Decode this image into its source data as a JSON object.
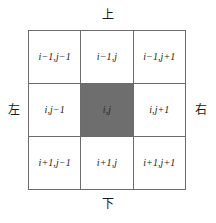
{
  "figure": {
    "type": "grid-neighborhood-diagram",
    "rows": 3,
    "columns": 3,
    "colors": {
      "background": "#ffffff",
      "grid_line": "#6b6b6b",
      "center_cell_fill": "#6e6e6e",
      "text": "#1a1a1a"
    }
  },
  "direction_labels": {
    "top": "上",
    "bottom": "下",
    "left": "左",
    "right": "右"
  },
  "grid": {
    "cells": [
      {
        "row": 0,
        "column": 0,
        "label": "i−1,j−1",
        "highlighted": false
      },
      {
        "row": 0,
        "column": 1,
        "label": "i−1,j",
        "highlighted": false
      },
      {
        "row": 0,
        "column": 2,
        "label": "i−1,j+1",
        "highlighted": false
      },
      {
        "row": 1,
        "column": 0,
        "label": "i,j−1",
        "highlighted": false
      },
      {
        "row": 1,
        "column": 1,
        "label": "i,j",
        "highlighted": true
      },
      {
        "row": 1,
        "column": 2,
        "label": "i,j+1",
        "highlighted": false
      },
      {
        "row": 2,
        "column": 0,
        "label": "i+1,j−1",
        "highlighted": false
      },
      {
        "row": 2,
        "column": 1,
        "label": "i+1,j",
        "highlighted": false
      },
      {
        "row": 2,
        "column": 2,
        "label": "i+1,j+1",
        "highlighted": false
      }
    ]
  }
}
